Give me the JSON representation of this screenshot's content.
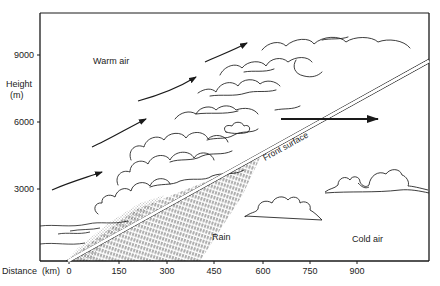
{
  "diagram": {
    "type": "warm-front cross-section",
    "labels": {
      "warm_air": "Warm air",
      "cold_air": "Cold air",
      "rain": "Rain",
      "front_surface": "Front surface"
    },
    "y_axis": {
      "title_line1": "Height",
      "title_line2": "(m)",
      "ticks": [
        "9000",
        "6000",
        "3000"
      ]
    },
    "x_axis": {
      "title": "Distance",
      "unit": "(km)",
      "ticks": [
        "0",
        "150",
        "300",
        "450",
        "600",
        "750",
        "900"
      ]
    },
    "arrows": {
      "warm_air_flow_count": 5,
      "front_movement": "right"
    },
    "colors": {
      "ink": "#1a1a1a",
      "background": "#ffffff"
    }
  }
}
